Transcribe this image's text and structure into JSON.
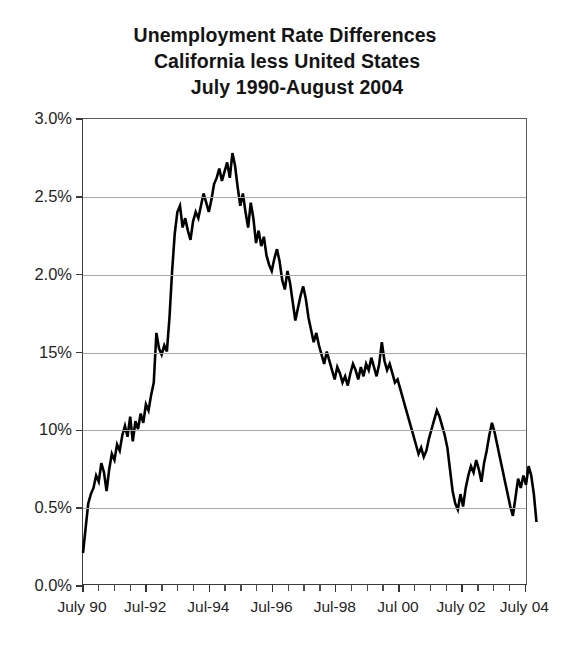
{
  "chart_data": {
    "type": "line",
    "title": "Unemployment Rate Differences",
    "title_lines": [
      "Unemployment Rate Differences",
      "California less United States",
      "July 1990-August 2004"
    ],
    "subtitle": "California less United States",
    "period": "July 1990-August 2004",
    "xlabel": "",
    "ylabel": "",
    "ylim": [
      0.0,
      3.0
    ],
    "yticks": [
      0.0,
      0.5,
      1.0,
      1.5,
      2.0,
      2.5,
      3.0
    ],
    "ytick_labels": [
      "0.0%",
      "0.5%",
      "10%",
      "15%",
      "2.0%",
      "2.5%",
      "3.0%"
    ],
    "ytick_labels_note": "As rendered in the scan; the 1.0% and 1.5% labels print without their decimal points",
    "grid": true,
    "grid_axis": "y",
    "legend": null,
    "xlim": [
      "1990-07",
      "2004-08"
    ],
    "xtick_labels": [
      "July 90",
      "Jul-92",
      "Jul-94",
      "Jul-96",
      "Jul-98",
      "Jul 00",
      "July 02",
      "July 04"
    ],
    "xtick_positions": [
      "1990-07",
      "1992-07",
      "1994-07",
      "1996-07",
      "1998-07",
      "2000-07",
      "2002-07",
      "2004-07"
    ],
    "minor_tick_interval_months": 6,
    "series": [
      {
        "name": "California less United States unemployment rate difference",
        "color": "#000000",
        "units": "percentage points",
        "x_start": "1990-07",
        "x_step_months": 1,
        "n_points": 170,
        "values": [
          0.2,
          0.36,
          0.52,
          0.58,
          0.62,
          0.7,
          0.66,
          0.78,
          0.72,
          0.6,
          0.74,
          0.84,
          0.8,
          0.9,
          0.86,
          0.96,
          1.02,
          0.95,
          1.08,
          0.92,
          1.05,
          1.0,
          1.1,
          1.04,
          1.16,
          1.12,
          1.22,
          1.3,
          1.62,
          1.52,
          1.48,
          1.54,
          1.5,
          1.72,
          2.02,
          2.26,
          2.4,
          2.44,
          2.3,
          2.36,
          2.28,
          2.22,
          2.34,
          2.4,
          2.36,
          2.44,
          2.52,
          2.46,
          2.4,
          2.48,
          2.58,
          2.62,
          2.68,
          2.6,
          2.66,
          2.72,
          2.62,
          2.78,
          2.7,
          2.56,
          2.44,
          2.52,
          2.4,
          2.3,
          2.46,
          2.36,
          2.2,
          2.28,
          2.18,
          2.24,
          2.12,
          2.06,
          2.02,
          2.1,
          2.16,
          2.08,
          1.96,
          1.9,
          2.02,
          1.94,
          1.82,
          1.7,
          1.78,
          1.86,
          1.92,
          1.84,
          1.72,
          1.64,
          1.56,
          1.62,
          1.54,
          1.48,
          1.42,
          1.5,
          1.44,
          1.38,
          1.32,
          1.4,
          1.36,
          1.3,
          1.34,
          1.28,
          1.36,
          1.42,
          1.38,
          1.32,
          1.4,
          1.34,
          1.42,
          1.38,
          1.46,
          1.4,
          1.34,
          1.42,
          1.56,
          1.44,
          1.38,
          1.42,
          1.36,
          1.3,
          1.32,
          1.26,
          1.2,
          1.14,
          1.08,
          1.02,
          0.96,
          0.9,
          0.84,
          0.88,
          0.82,
          0.86,
          0.94,
          1.0,
          1.06,
          1.12,
          1.08,
          1.02,
          0.96,
          0.88,
          0.74,
          0.6,
          0.52,
          0.48,
          0.58,
          0.5,
          0.62,
          0.7,
          0.76,
          0.72,
          0.8,
          0.74,
          0.66,
          0.78,
          0.86,
          0.96,
          1.04,
          0.98,
          0.9,
          0.82,
          0.74,
          0.66,
          0.58,
          0.5,
          0.44,
          0.56,
          0.68,
          0.62,
          0.7,
          0.64,
          0.76,
          0.7,
          0.58,
          0.4
        ]
      }
    ]
  }
}
